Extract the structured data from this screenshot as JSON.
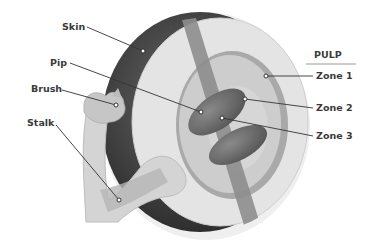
{
  "diagram": {
    "left_labels": {
      "skin": "Skin",
      "pip": "Pip",
      "brush": "Brush",
      "stalk": "Stalk"
    },
    "pulp_group": {
      "heading": "PULP",
      "zones": [
        "Zone 1",
        "Zone 2",
        "Zone 3"
      ]
    },
    "colors": {
      "skin": "#4a4a4a",
      "zone1": "#e6e6e6",
      "zone2": "#c8c8c8",
      "zone3": "#d2d2d2",
      "pip": "#6e6e6e",
      "vascular": "#8c8c8c",
      "stalk": "#cfcfcf",
      "text": "#3a3a3a",
      "leader": "#333333"
    }
  }
}
